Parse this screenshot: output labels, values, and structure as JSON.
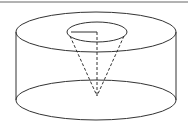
{
  "diagram": {
    "type": "geometry",
    "stroke_color": "#333333",
    "dash_color": "#333333",
    "background": "#ffffff",
    "top_border": {
      "y": 2,
      "color": "#555555"
    },
    "cylinder": {
      "left_x": 16,
      "right_x": 176,
      "center_x": 96,
      "top_cy": 32,
      "bottom_cy": 100,
      "rx": 80,
      "ry": 20
    },
    "cone": {
      "base_cx": 97,
      "base_cy": 32,
      "base_rx": 30,
      "base_ry": 10,
      "apex_x": 97,
      "apex_y": 96,
      "radius_end_x": 71,
      "radius_end_y": 32
    }
  }
}
